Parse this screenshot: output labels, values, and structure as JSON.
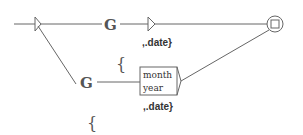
{
  "graph": {
    "type": "finite-state transducer graph",
    "colors": {
      "line": "#666666",
      "text": "#333333",
      "background": "#ffffff"
    },
    "nodes": {
      "top_G": {
        "label": "G",
        "output": ",.date}"
      },
      "brace_top": {
        "label": "{"
      },
      "bottom_G": {
        "label": "G"
      },
      "box": {
        "lines": [
          "month",
          "year"
        ],
        "output": ",.date}"
      },
      "brace_bottom": {
        "label": "{"
      },
      "final_state": {
        "icon": "final-state-icon"
      },
      "initial_state": {
        "icon": "initial-arrow-icon"
      }
    }
  }
}
